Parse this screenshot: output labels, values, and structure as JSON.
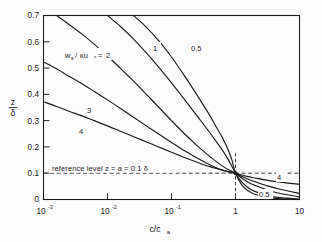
{
  "chart_data": {
    "type": "line",
    "title": "",
    "xlabel": "c/c_a",
    "ylabel": "z/δ",
    "xscale": "log",
    "yscale": "linear",
    "xlim": [
      0.001,
      10
    ],
    "ylim": [
      0,
      0.7
    ],
    "grid": false,
    "legend_position": "inline-curve-labels",
    "xticks": [
      {
        "value": 0.001,
        "label": "10",
        "exponent": "-3"
      },
      {
        "value": 0.01,
        "label": "10",
        "exponent": "-2"
      },
      {
        "value": 0.1,
        "label": "10",
        "exponent": "-1"
      },
      {
        "value": 1,
        "label": "1",
        "exponent": ""
      },
      {
        "value": 10,
        "label": "10",
        "exponent": ""
      }
    ],
    "yticks": [
      {
        "value": 0,
        "label": "0"
      },
      {
        "value": 0.1,
        "label": "0.1"
      },
      {
        "value": 0.2,
        "label": "0.2"
      },
      {
        "value": 0.3,
        "label": "0.3"
      },
      {
        "value": 0.4,
        "label": "0.4"
      },
      {
        "value": 0.5,
        "label": "0.5"
      },
      {
        "value": 0.6,
        "label": "0.6"
      },
      {
        "value": 0.7,
        "label": "0.7"
      }
    ],
    "parameter_symbol": "w",
    "parameter_sub": "s",
    "parameter_denom": "κu",
    "parameter_denom_sub": "*",
    "parameter_equation": "w_s/κu_* = 2",
    "reference_annotation": "reference level z = a = 0.1 δ",
    "reference_level_y": 0.1,
    "reference_level_x": 1,
    "convergence_point": {
      "x": 1,
      "y": 0.1
    },
    "series": [
      {
        "name": "0.5",
        "label": "0.5",
        "rouse_number": 0.5,
        "label_x": 0.205,
        "label_y": 0.632,
        "points_xy": [
          [
            0.0255,
            0.7
          ],
          [
            0.04,
            0.657
          ],
          [
            0.063,
            0.604
          ],
          [
            0.1,
            0.542
          ],
          [
            0.158,
            0.472
          ],
          [
            0.251,
            0.397
          ],
          [
            0.398,
            0.319
          ],
          [
            0.501,
            0.276
          ],
          [
            0.631,
            0.233
          ],
          [
            0.794,
            0.181
          ],
          [
            0.891,
            0.146
          ],
          [
            1.0,
            0.1
          ],
          [
            1.26,
            0.055
          ],
          [
            1.58,
            0.033
          ],
          [
            2.0,
            0.02
          ],
          [
            3.16,
            0.008
          ],
          [
            5.0,
            0.003
          ],
          [
            7.94,
            0.0008
          ]
        ]
      },
      {
        "name": "1",
        "label": "1",
        "rouse_number": 1.0,
        "label_x": 0.059,
        "label_y": 0.635,
        "points_xy": [
          [
            0.01,
            0.7
          ],
          [
            0.0158,
            0.659
          ],
          [
            0.0251,
            0.612
          ],
          [
            0.0398,
            0.56
          ],
          [
            0.0631,
            0.504
          ],
          [
            0.1,
            0.444
          ],
          [
            0.158,
            0.382
          ],
          [
            0.251,
            0.318
          ],
          [
            0.398,
            0.254
          ],
          [
            0.501,
            0.22
          ],
          [
            0.631,
            0.186
          ],
          [
            0.794,
            0.146
          ],
          [
            0.891,
            0.123
          ],
          [
            1.0,
            0.1
          ],
          [
            1.26,
            0.066
          ],
          [
            1.58,
            0.045
          ],
          [
            2.0,
            0.031
          ],
          [
            3.16,
            0.015
          ],
          [
            5.0,
            0.007
          ],
          [
            10.0,
            0.002
          ]
        ]
      },
      {
        "name": "2",
        "label": "2",
        "rouse_number": 2.0,
        "label_x": 0.0072,
        "label_y": 0.513,
        "points_xy": [
          [
            0.0016,
            0.7
          ],
          [
            0.0025,
            0.666
          ],
          [
            0.004,
            0.629
          ],
          [
            0.0063,
            0.589
          ],
          [
            0.01,
            0.546
          ],
          [
            0.0158,
            0.5
          ],
          [
            0.0251,
            0.452
          ],
          [
            0.0398,
            0.402
          ],
          [
            0.0631,
            0.351
          ],
          [
            0.1,
            0.3
          ],
          [
            0.158,
            0.251
          ],
          [
            0.251,
            0.205
          ],
          [
            0.398,
            0.163
          ],
          [
            0.501,
            0.144
          ],
          [
            0.631,
            0.127
          ],
          [
            0.794,
            0.112
          ],
          [
            1.0,
            0.1
          ],
          [
            1.26,
            0.081
          ],
          [
            1.58,
            0.066
          ],
          [
            2.0,
            0.054
          ],
          [
            3.16,
            0.036
          ],
          [
            5.0,
            0.023
          ],
          [
            10.0,
            0.01
          ]
        ]
      },
      {
        "name": "3",
        "label": "3",
        "rouse_number": 3.0,
        "label_x": 0.0068,
        "label_y": 0.347,
        "points_xy": [
          [
            0.001,
            0.523
          ],
          [
            0.0016,
            0.497
          ],
          [
            0.0025,
            0.469
          ],
          [
            0.004,
            0.44
          ],
          [
            0.0063,
            0.41
          ],
          [
            0.01,
            0.379
          ],
          [
            0.0158,
            0.347
          ],
          [
            0.0251,
            0.314
          ],
          [
            0.0398,
            0.281
          ],
          [
            0.0631,
            0.249
          ],
          [
            0.1,
            0.217
          ],
          [
            0.158,
            0.186
          ],
          [
            0.251,
            0.158
          ],
          [
            0.398,
            0.132
          ],
          [
            0.501,
            0.121
          ],
          [
            0.631,
            0.112
          ],
          [
            0.794,
            0.105
          ],
          [
            1.0,
            0.1
          ],
          [
            1.26,
            0.088
          ],
          [
            1.58,
            0.077
          ],
          [
            2.0,
            0.068
          ],
          [
            3.16,
            0.052
          ],
          [
            5.0,
            0.039
          ],
          [
            10.0,
            0.023
          ]
        ]
      },
      {
        "name": "4",
        "label": "4",
        "rouse_number": 4.0,
        "label_x": 0.0075,
        "label_y": 0.266,
        "points_xy": [
          [
            0.001,
            0.372
          ],
          [
            0.0016,
            0.354
          ],
          [
            0.0025,
            0.336
          ],
          [
            0.004,
            0.318
          ],
          [
            0.0063,
            0.299
          ],
          [
            0.01,
            0.28
          ],
          [
            0.0158,
            0.26
          ],
          [
            0.0251,
            0.24
          ],
          [
            0.0398,
            0.22
          ],
          [
            0.0631,
            0.2
          ],
          [
            0.1,
            0.18
          ],
          [
            0.158,
            0.16
          ],
          [
            0.251,
            0.142
          ],
          [
            0.398,
            0.125
          ],
          [
            0.501,
            0.118
          ],
          [
            0.631,
            0.111
          ],
          [
            0.794,
            0.105
          ],
          [
            1.0,
            0.1
          ],
          [
            1.26,
            0.093
          ],
          [
            1.58,
            0.087
          ],
          [
            2.0,
            0.082
          ],
          [
            3.16,
            0.073
          ],
          [
            5.0,
            0.066
          ],
          [
            10.0,
            0.058
          ]
        ]
      }
    ],
    "right_labels": [
      {
        "text": "4",
        "x": 6.3,
        "y": 0.07
      },
      {
        "text": "0.5",
        "x": 3.0,
        "y": 0.017
      }
    ]
  }
}
